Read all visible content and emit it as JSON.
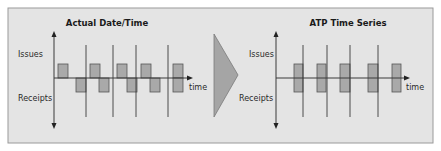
{
  "left_panel": {
    "title": "Actual Date/Time",
    "y_label_top": "Issues",
    "y_label_bottom": "Receipts",
    "x_label": "time",
    "issue_bars_x": [
      [
        58,
        68
      ],
      [
        90,
        100
      ],
      [
        117,
        127
      ],
      [
        141,
        151
      ],
      [
        173,
        183
      ]
    ],
    "receipt_bars_x": [
      [
        76,
        86
      ],
      [
        99,
        109
      ],
      [
        127,
        137
      ],
      [
        150,
        160
      ],
      [
        173,
        183
      ]
    ],
    "dividers_x": [
      86,
      113,
      136,
      168
    ]
  },
  "right_panel": {
    "title": "ATP Time Series",
    "y_label_top": "Issues",
    "y_label_bottom": "Receipts",
    "x_label": "time",
    "bars_x": [
      [
        294,
        303
      ],
      [
        317,
        326
      ],
      [
        340,
        350
      ],
      [
        368,
        378
      ],
      [
        392,
        401
      ]
    ],
    "dividers_x": [
      303,
      327,
      350,
      378
    ]
  },
  "colors": {
    "panel_bg": "#e4e4e4",
    "panel_border": "#9a9a9a",
    "bar_fill": "#a9a9a9",
    "line": "#3a3a3a",
    "arrow_fill": "#a5a5a5"
  }
}
